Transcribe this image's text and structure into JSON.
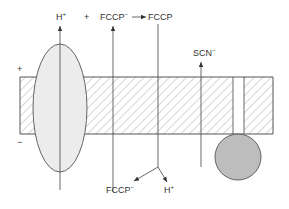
{
  "diagram": {
    "type": "membrane-transport-schematic",
    "colors": {
      "stroke": "#444444",
      "hatch": "#888888",
      "ellipse_fill": "#ececec",
      "circle_fill": "#bdbdbd",
      "text": "#333333"
    },
    "side_labels": {
      "outside_top": "+",
      "outside_bottom": "−",
      "near_fccp": "+"
    },
    "labels": {
      "h_plus_top": {
        "base": "H",
        "sup": "+"
      },
      "fccp_anion_top": {
        "base": "FCCP",
        "sup": "−"
      },
      "fccp_neutral_top": {
        "base": "FCCP",
        "sup": ""
      },
      "scn_anion": {
        "base": "SCN",
        "sup": "−"
      },
      "fccp_anion_bottom": {
        "base": "FCCP",
        "sup": "−"
      },
      "h_plus_bottom": {
        "base": "H",
        "sup": "+"
      }
    },
    "elements": [
      {
        "name": "membrane",
        "shape": "hatched-rectangle"
      },
      {
        "name": "proton-pump",
        "shape": "ellipse"
      },
      {
        "name": "membrane-gap-channel",
        "shape": "gap"
      },
      {
        "name": "attached-particle",
        "shape": "circle"
      }
    ]
  }
}
